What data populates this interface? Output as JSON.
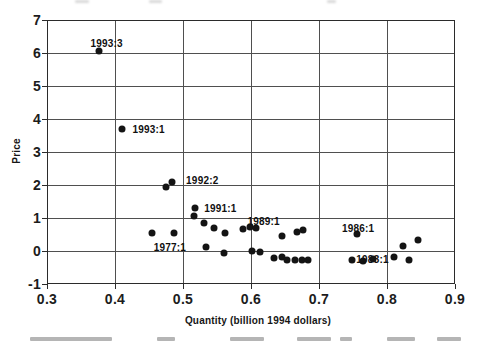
{
  "chart_data": {
    "type": "scatter",
    "title": "",
    "xlabel": "Quantity (billion 1994 dollars)",
    "ylabel": "Price",
    "xlim": [
      0.3,
      0.9
    ],
    "ylim": [
      -1,
      7
    ],
    "grid": true,
    "legend": "none",
    "marker_color": "#141414",
    "grid_color": "#4f4f4f",
    "xticks": [
      {
        "v": 0.3,
        "label": "0.3"
      },
      {
        "v": 0.4,
        "label": "0.4"
      },
      {
        "v": 0.5,
        "label": "0.5"
      },
      {
        "v": 0.6,
        "label": "0.6"
      },
      {
        "v": 0.7,
        "label": "0.7"
      },
      {
        "v": 0.8,
        "label": "0.8"
      },
      {
        "v": 0.9,
        "label": "0.9"
      }
    ],
    "yticks": [
      {
        "v": -1,
        "label": "-1"
      },
      {
        "v": 0,
        "label": "0"
      },
      {
        "v": 1,
        "label": "1"
      },
      {
        "v": 2,
        "label": "2"
      },
      {
        "v": 3,
        "label": "3"
      },
      {
        "v": 4,
        "label": "4"
      },
      {
        "v": 5,
        "label": "5"
      },
      {
        "v": 6,
        "label": "6"
      },
      {
        "v": 7,
        "label": "7"
      }
    ],
    "points": [
      {
        "x": 0.376,
        "y": 6.05,
        "label": "1993:3",
        "pos": "above",
        "dx": 8,
        "dy": 0
      },
      {
        "x": 0.411,
        "y": 3.7,
        "label": "1993:1",
        "pos": "right",
        "dx": 3,
        "dy": 0
      },
      {
        "x": 0.475,
        "y": 1.95
      },
      {
        "x": 0.484,
        "y": 2.1,
        "label": "1992:2",
        "pos": "right",
        "dx": 7,
        "dy": -2
      },
      {
        "x": 0.455,
        "y": 0.55
      },
      {
        "x": 0.487,
        "y": 0.55
      },
      {
        "x": 0.518,
        "y": 1.3,
        "label": "1991:1",
        "pos": "right",
        "dx": 2,
        "dy": 0
      },
      {
        "x": 0.516,
        "y": 1.05
      },
      {
        "x": 0.531,
        "y": 0.85
      },
      {
        "x": 0.546,
        "y": 0.7
      },
      {
        "x": 0.562,
        "y": 0.55
      },
      {
        "x": 0.534,
        "y": 0.12,
        "label": "1977:1",
        "pos": "left",
        "dx": -13,
        "dy": 0
      },
      {
        "x": 0.561,
        "y": -0.05
      },
      {
        "x": 0.588,
        "y": 0.68
      },
      {
        "x": 0.598,
        "y": 0.73,
        "label": "1989:1",
        "pos": "above",
        "dx": 14,
        "dy": 2
      },
      {
        "x": 0.608,
        "y": 0.7
      },
      {
        "x": 0.645,
        "y": 0.45
      },
      {
        "x": 0.667,
        "y": 0.58
      },
      {
        "x": 0.676,
        "y": 0.63
      },
      {
        "x": 0.601,
        "y": 0.0
      },
      {
        "x": 0.613,
        "y": -0.03
      },
      {
        "x": 0.634,
        "y": -0.22
      },
      {
        "x": 0.645,
        "y": -0.17
      },
      {
        "x": 0.653,
        "y": -0.26
      },
      {
        "x": 0.665,
        "y": -0.26
      },
      {
        "x": 0.675,
        "y": -0.26
      },
      {
        "x": 0.684,
        "y": -0.26
      },
      {
        "x": 0.756,
        "y": 0.52,
        "label": "1986:1",
        "pos": "above",
        "dx": 1,
        "dy": 2
      },
      {
        "x": 0.748,
        "y": -0.28
      },
      {
        "x": 0.764,
        "y": -0.29,
        "label": "1983:1",
        "pos": "above",
        "dx": 10,
        "dy": 6
      },
      {
        "x": 0.78,
        "y": -0.25
      },
      {
        "x": 0.81,
        "y": -0.18
      },
      {
        "x": 0.832,
        "y": -0.28
      },
      {
        "x": 0.824,
        "y": 0.15
      },
      {
        "x": 0.845,
        "y": 0.32
      }
    ]
  }
}
